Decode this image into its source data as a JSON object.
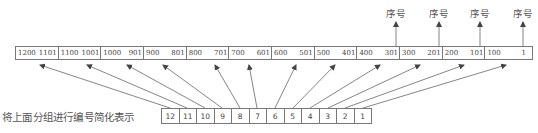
{
  "diagram": {
    "top_groups": [
      {
        "high": "1200",
        "low": "1101"
      },
      {
        "high": "1100",
        "low": "1001"
      },
      {
        "high": "1000",
        "low": "901"
      },
      {
        "high": "900",
        "low": "801"
      },
      {
        "high": "800",
        "low": "701"
      },
      {
        "high": "700",
        "low": "601"
      },
      {
        "high": "600",
        "low": "501"
      },
      {
        "high": "500",
        "low": "401"
      },
      {
        "high": "400",
        "low": "301"
      },
      {
        "high": "300",
        "low": "201"
      },
      {
        "high": "200",
        "low": "101"
      },
      {
        "high": "100",
        "low": "1"
      }
    ],
    "group_numbers": [
      "12",
      "11",
      "10",
      "9",
      "8",
      "7",
      "6",
      "5",
      "4",
      "3",
      "2",
      "1"
    ],
    "caption": "将上面分组进行编号简化表示",
    "seq_labels": [
      "序号",
      "序号",
      "序号",
      "序号"
    ],
    "colors": {
      "line": "#777777",
      "arrow": "#555555",
      "text": "#444444"
    }
  }
}
